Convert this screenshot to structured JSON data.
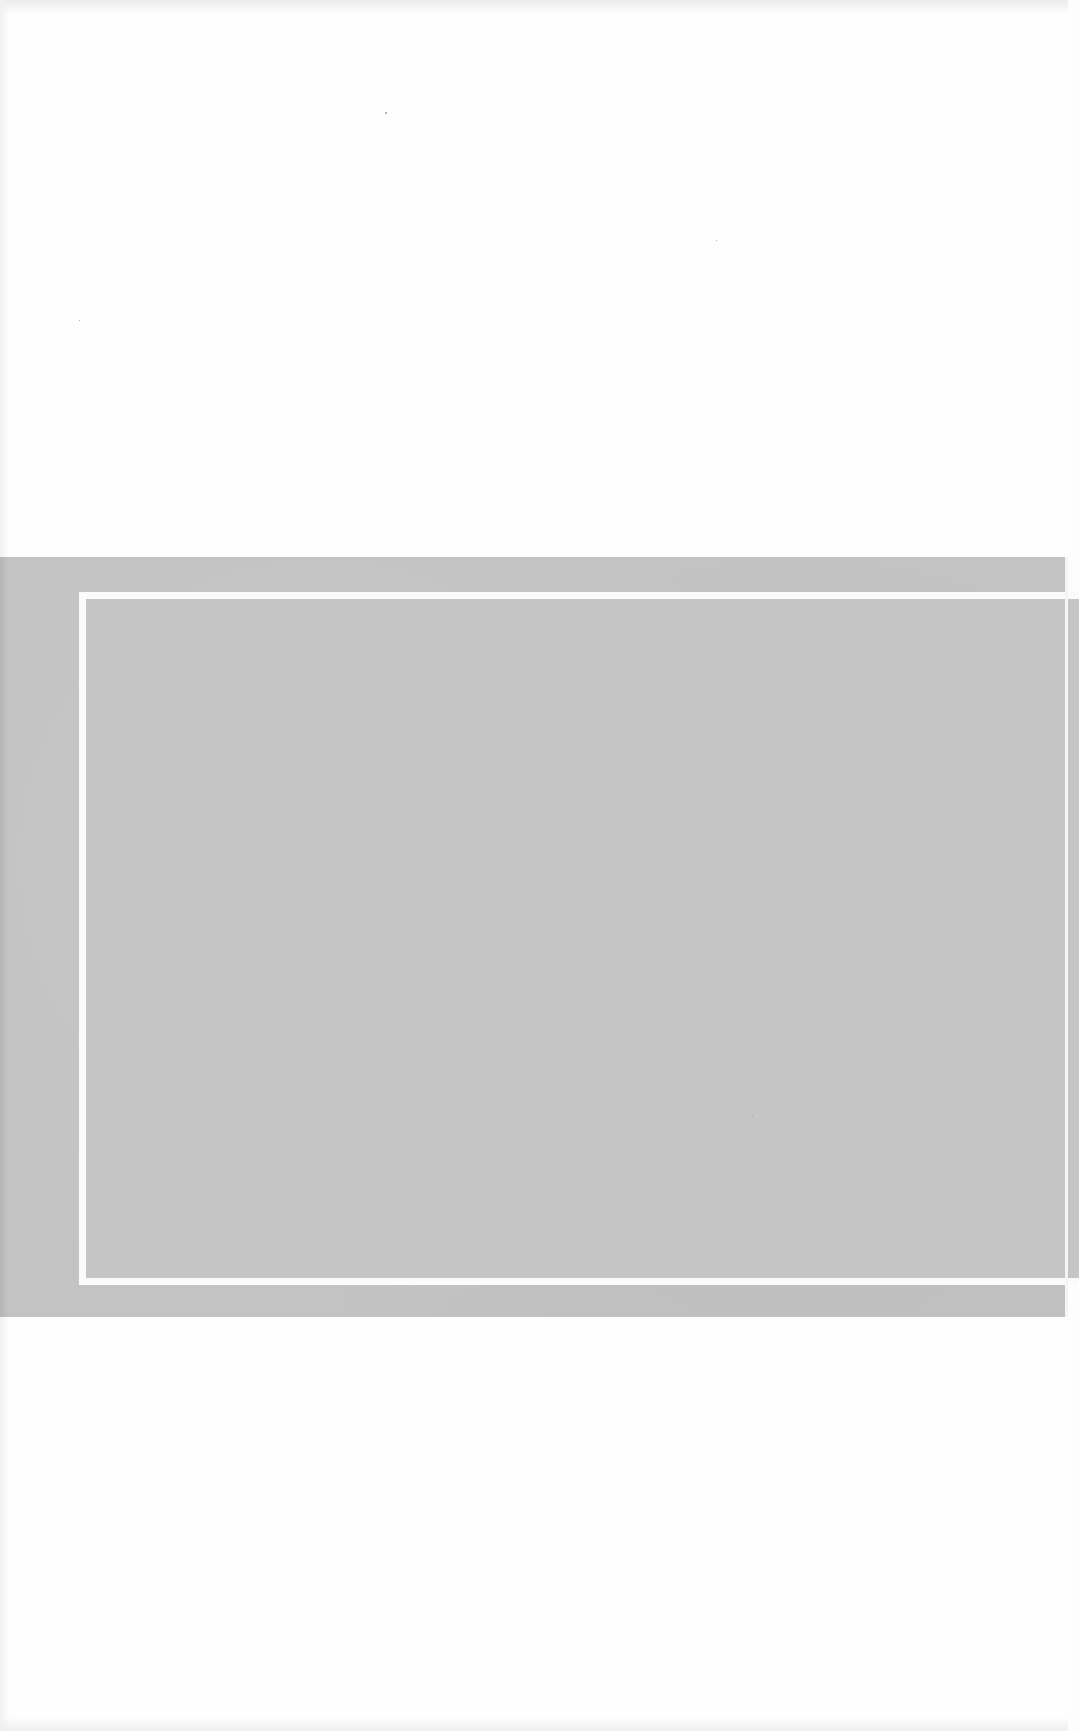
{
  "page": {
    "type": "scanned-blank-page",
    "background_color": "#fefefe"
  },
  "band": {
    "color": "#c3c3c3",
    "frame_color": "#fbfbfb"
  },
  "text": {}
}
